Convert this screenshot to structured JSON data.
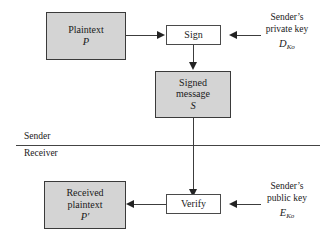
{
  "diagram": {
    "colors": {
      "node_fill": "#d4d4d4",
      "node_border": "#3a3a3a",
      "plain_fill": "#ffffff",
      "line": "#3c3c3c",
      "arrowhead": "#232323",
      "text": "#1a1a1a",
      "background": "#ffffff"
    },
    "nodes": {
      "plaintext": {
        "label": "Plaintext",
        "symbol": "P"
      },
      "sign": {
        "label": "Sign"
      },
      "signed_message": {
        "label_line1": "Signed",
        "label_line2": "message",
        "symbol": "S"
      },
      "verify": {
        "label": "Verify"
      },
      "received_plaintext": {
        "label_line1": "Received",
        "label_line2": "plaintext",
        "symbol": "P′"
      }
    },
    "key_labels": {
      "private_key": {
        "line1": "Sender’s",
        "line2": "private key",
        "symbol_base": "D",
        "symbol_sub": "Ko"
      },
      "public_key": {
        "line1": "Sender’s",
        "line2": "public key",
        "symbol_base": "E",
        "symbol_sub": "Ko"
      }
    },
    "zones": {
      "sender": "Sender",
      "receiver": "Receiver"
    }
  }
}
